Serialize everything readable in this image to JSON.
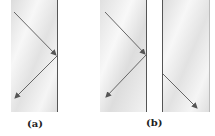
{
  "figure": {
    "panels": [
      {
        "id": "a",
        "label": "(a)",
        "description": "Total internal reflection inside a single glass block"
      },
      {
        "id": "b",
        "label": "(b)",
        "description": "Frustrated total internal reflection: ray tunnels across a narrow gap into a second block"
      }
    ]
  },
  "colors": {
    "glass_light": "#f4f4f4",
    "glass_dark": "#d9d9d9",
    "edge": "#555555",
    "arrow": "#555555"
  }
}
